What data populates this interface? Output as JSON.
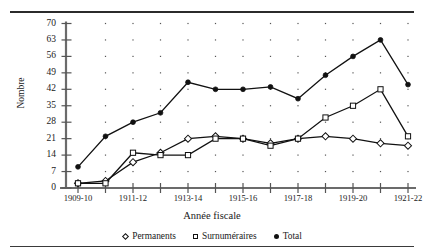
{
  "figure": {
    "title": "",
    "axis_title_x": "Année fiscale",
    "axis_title_y": "Nombre"
  },
  "legend": {
    "position": "bottom-center",
    "items": [
      {
        "label": "Permanents",
        "marker": "diamond-open-icon"
      },
      {
        "label": "Surnuméraires",
        "marker": "square-open-icon"
      },
      {
        "label": "Total",
        "marker": "circle-filled-icon"
      }
    ]
  },
  "chart_data": {
    "type": "line",
    "title": "",
    "xlabel": "Année fiscale",
    "ylabel": "Nombre",
    "grid": "dotted-point-grid",
    "ylim": [
      0,
      70
    ],
    "yticks": [
      0,
      7,
      14,
      21,
      28,
      35,
      42,
      49,
      56,
      63,
      70
    ],
    "ytick_labels": [
      "0",
      "7",
      "14",
      "21",
      "28",
      "35",
      "42",
      "49",
      "56",
      "63",
      "70"
    ],
    "x": [
      "1909-10",
      "1910-11",
      "1911-12",
      "1912-13",
      "1913-14",
      "1914-15",
      "1915-16",
      "1916-17",
      "1917-18",
      "1918-19",
      "1919-20",
      "1920-21",
      "1921-22"
    ],
    "xtick_labels": [
      "1909-10",
      "",
      "1911-12",
      "",
      "1913-14",
      "",
      "1915-16",
      "",
      "1917-18",
      "",
      "1919-20",
      "",
      "1921-22"
    ],
    "series": [
      {
        "name": "Permanents",
        "marker": "diamond-open",
        "color": "#111111",
        "values": [
          2,
          3,
          11,
          15,
          21,
          22,
          21,
          19,
          21,
          22,
          21,
          19,
          18
        ]
      },
      {
        "name": "Surnuméraires",
        "marker": "square-open",
        "color": "#111111",
        "values": [
          2,
          2,
          15,
          14,
          14,
          21,
          21,
          18,
          21,
          30,
          35,
          42,
          22
        ]
      },
      {
        "name": "Total",
        "marker": "circle-filled",
        "color": "#111111",
        "values": [
          9,
          22,
          28,
          32,
          45,
          42,
          42,
          43,
          38,
          48,
          56,
          63,
          44
        ]
      }
    ]
  }
}
